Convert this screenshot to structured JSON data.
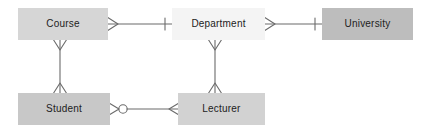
{
  "diagram": {
    "type": "er-diagram",
    "notation": "crow's-foot",
    "background_color": "#ffffff",
    "line_color": "#6b6b6b",
    "text_color": "#222222",
    "entities": [
      {
        "id": "course",
        "label": "Course",
        "x": 18,
        "y": 8,
        "width": 90,
        "height": 32,
        "fill": "#d6d6d6"
      },
      {
        "id": "department",
        "label": "Department",
        "x": 172,
        "y": 8,
        "width": 93,
        "height": 32,
        "fill": "#f4f4f4"
      },
      {
        "id": "university",
        "label": "University",
        "x": 322,
        "y": 8,
        "width": 91,
        "height": 32,
        "fill": "#bdbdbd"
      },
      {
        "id": "student",
        "label": "Student",
        "x": 18,
        "y": 93,
        "width": 92,
        "height": 32,
        "fill": "#c8c8c8"
      },
      {
        "id": "lecturer",
        "label": "Lecturer",
        "x": 178,
        "y": 93,
        "width": 87,
        "height": 32,
        "fill": "#d2d2d2"
      }
    ],
    "relationships": [
      {
        "id": "course-department",
        "from": "course",
        "to": "department",
        "from_cardinality": "many",
        "to_cardinality": "one",
        "orientation": "horizontal"
      },
      {
        "id": "department-university",
        "from": "department",
        "to": "university",
        "from_cardinality": "many",
        "to_cardinality": "one",
        "orientation": "horizontal"
      },
      {
        "id": "course-student",
        "from": "course",
        "to": "student",
        "from_cardinality": "many",
        "to_cardinality": "many",
        "orientation": "vertical"
      },
      {
        "id": "department-lecturer",
        "from": "department",
        "to": "lecturer",
        "from_cardinality": "many",
        "to_cardinality": "many",
        "orientation": "vertical"
      },
      {
        "id": "student-lecturer",
        "from": "student",
        "to": "lecturer",
        "from_cardinality": "zero-or-many",
        "to_cardinality": "many",
        "orientation": "horizontal"
      }
    ]
  }
}
